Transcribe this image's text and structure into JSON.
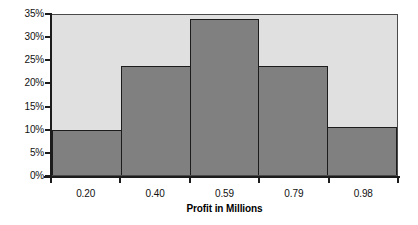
{
  "chart_data": {
    "type": "bar",
    "title": "",
    "subtitle": "",
    "xlabel": "Profit in Millions",
    "ylabel": "",
    "categories": [
      "0.20",
      "0.40",
      "0.59",
      "0.79",
      "0.98"
    ],
    "values": [
      9.7,
      23.6,
      33.8,
      23.6,
      10.4
    ],
    "value_labels": [
      "9.7%",
      "23.6%",
      "33.8%",
      "23.6%",
      "10.4%"
    ],
    "ylim": [
      0,
      35
    ],
    "xlim_labels": [
      "0.20",
      "0.98"
    ],
    "y_ticks": [
      0,
      5,
      10,
      15,
      20,
      25,
      30,
      35
    ],
    "y_tick_labels": [
      "0%",
      "5%",
      "10%",
      "15%",
      "20%",
      "25%",
      "30%",
      "35%"
    ],
    "x_tick_labels": [
      "0.20",
      "0.40",
      "0.59",
      "0.79",
      "0.98"
    ],
    "grid": false,
    "legend": null,
    "legend_position": "none",
    "annotations": [],
    "colors": {
      "bar_fill": "#808080",
      "bar_border": "#1c1c1c",
      "plot_background": "#e0e0e0",
      "page_background": "#ffffff",
      "axis": "#1c1c1c",
      "text": "#111111"
    }
  }
}
